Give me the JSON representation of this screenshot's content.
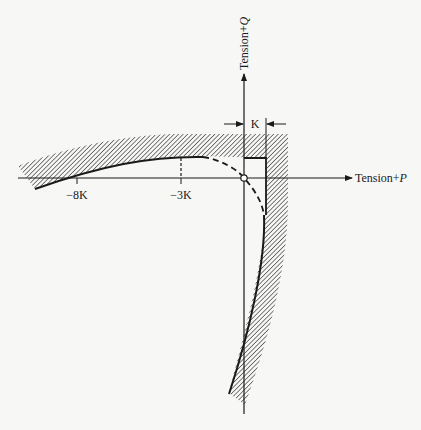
{
  "figure": {
    "axes": {
      "x_label_prefix": "Tension",
      "x_label_plus": "+",
      "x_label_var": "P",
      "y_label_prefix": "Tension",
      "y_label_plus": "+",
      "y_label_var": "Q"
    },
    "ticks": {
      "minus_8k": "−8K",
      "minus_3k": "−3K"
    },
    "dimension": {
      "k_label": "K"
    },
    "colors": {
      "ink": "#1a1a1a",
      "hatch": "#333333",
      "background": "#f7f7f5"
    }
  }
}
